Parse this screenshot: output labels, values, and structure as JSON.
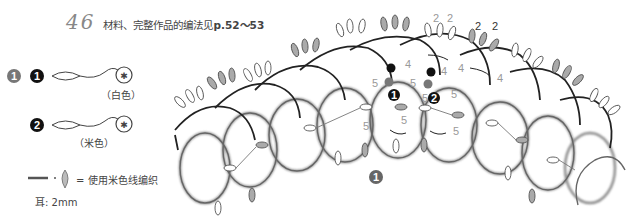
{
  "header": {
    "pattern_number": "46",
    "title_prefix": "材料、完整作品的编法见",
    "title_pages": "p.52～53"
  },
  "legend": {
    "shuttle_marker": "1",
    "shuttles": [
      {
        "id": "1",
        "color_label": "（白色）"
      },
      {
        "id": "2",
        "color_label": "（米色）"
      }
    ],
    "line_note": "= 使用米色线编织",
    "picot_note": "耳: 2mm"
  },
  "diagram": {
    "round_marker": "1",
    "start_markers": [
      "1",
      "2"
    ],
    "stitch_counts": {
      "ring_labels": [
        "5",
        "5",
        "5",
        "5",
        "5",
        "5",
        "5"
      ],
      "chain_labels": [
        "4",
        "4",
        "4",
        "4"
      ],
      "picot_labels": [
        "2",
        "2",
        "2",
        "2"
      ]
    },
    "colors": {
      "black_thread": "#222222",
      "beige_thread": "#888888",
      "picot_fill": "#aaaaaa",
      "marker_dark": "#111111",
      "marker_gray": "#777777"
    }
  }
}
